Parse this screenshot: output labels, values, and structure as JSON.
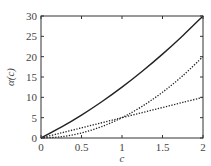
{
  "chart_data": {
    "type": "line",
    "title": "",
    "xlabel": "c",
    "ylabel": "α(c)",
    "xlim": [
      0,
      2
    ],
    "ylim": [
      0,
      30
    ],
    "xticks": [
      0,
      0.5,
      1,
      1.5,
      2
    ],
    "xtick_labels": [
      "0",
      "0.5",
      "1",
      "1.5",
      "2"
    ],
    "yticks": [
      0,
      5,
      10,
      15,
      20,
      25,
      30
    ],
    "ytick_labels": [
      "0",
      "5",
      "10",
      "15",
      "20",
      "25",
      "30"
    ],
    "grid": false,
    "legend": null,
    "x": [
      0,
      0.25,
      0.5,
      0.75,
      1,
      1.25,
      1.5,
      1.75,
      2
    ],
    "series": [
      {
        "name": "solid",
        "style": "solid",
        "values": [
          0,
          2.66,
          5.63,
          8.91,
          12.5,
          16.41,
          20.63,
          25.16,
          30
        ]
      },
      {
        "name": "dotted-quadratic",
        "style": "dotted",
        "values": [
          0,
          0.31,
          1.25,
          2.81,
          5,
          7.81,
          11.25,
          15.31,
          20
        ]
      },
      {
        "name": "dotted-linear",
        "style": "dotted",
        "values": [
          0,
          1.25,
          2.5,
          3.75,
          5,
          6.25,
          7.5,
          8.75,
          10
        ]
      }
    ]
  }
}
